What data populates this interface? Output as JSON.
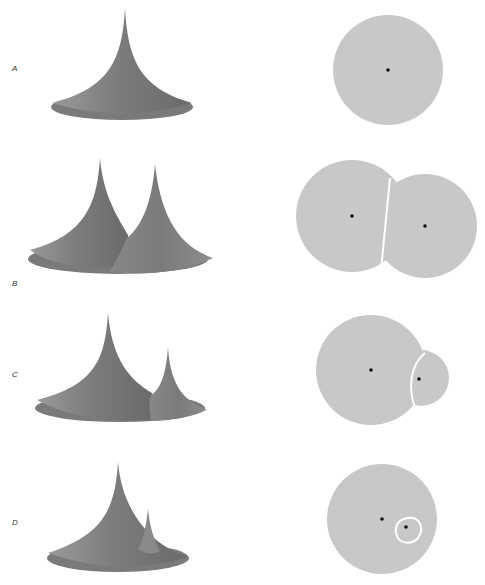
{
  "figure": {
    "panels": [
      {
        "label": "A",
        "description": "Single cone; one circular domain with one center point"
      },
      {
        "label": "B",
        "description": "Two equal cones; two domains divided by a nearly straight boundary"
      },
      {
        "label": "C",
        "description": "One large and one smaller cone; the smaller domain bounded by a curved arc"
      },
      {
        "label": "D",
        "description": "One large and one very small cone; the small domain is a closed loop inside the large one"
      }
    ],
    "colors": {
      "cone_fill": "#808080",
      "cone_shadow": "#5a5a5a",
      "domain_fill": "#c8c8c8",
      "boundary": "#ffffff",
      "center_dot": "#111111"
    }
  }
}
